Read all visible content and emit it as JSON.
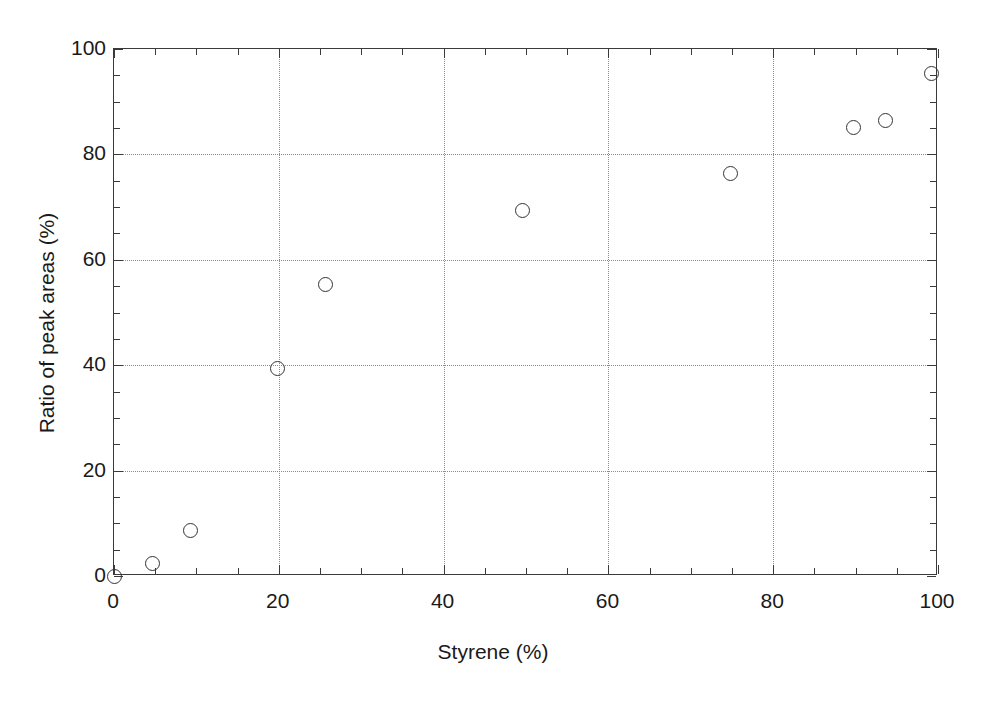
{
  "chart_data": {
    "type": "scatter",
    "title": "",
    "xlabel": "Styrene (%)",
    "ylabel": "Ratio of peak areas (%)",
    "xlim": [
      0,
      100
    ],
    "ylim": [
      0,
      100
    ],
    "x_ticks": [
      0,
      20,
      40,
      60,
      80,
      100
    ],
    "y_ticks": [
      0,
      20,
      40,
      60,
      80,
      100
    ],
    "x_tick_labels": [
      "0",
      "20",
      "40",
      "60",
      "80",
      "100"
    ],
    "y_tick_labels": [
      "0",
      "20",
      "40",
      "60",
      "80",
      "100"
    ],
    "x_minor_tick_interval": 5,
    "y_minor_tick_interval": 5,
    "grid": true,
    "grid_style": "dotted",
    "grid_color": "#8a8a8a",
    "legend": null,
    "marker_style": "open-circle",
    "marker_color": "#333333",
    "frame_color": "#3a3a3a",
    "background_color": "#ffffff",
    "series": [
      {
        "name": "Ratio of peak areas",
        "points": [
          {
            "x": 0.0,
            "y": 0.0
          },
          {
            "x": 4.7,
            "y": 2.3
          },
          {
            "x": 9.3,
            "y": 8.7
          },
          {
            "x": 19.9,
            "y": 39.3
          },
          {
            "x": 25.7,
            "y": 55.3
          },
          {
            "x": 49.6,
            "y": 69.4
          },
          {
            "x": 74.8,
            "y": 76.4
          },
          {
            "x": 89.8,
            "y": 85.1
          },
          {
            "x": 93.6,
            "y": 86.5
          },
          {
            "x": 99.2,
            "y": 95.4
          }
        ]
      }
    ]
  }
}
